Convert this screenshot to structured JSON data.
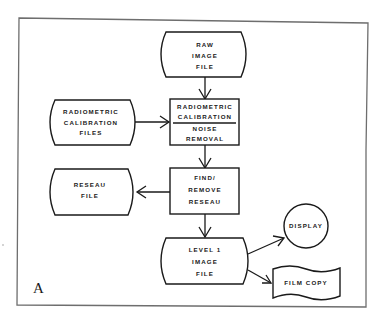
{
  "diagram": {
    "panel_label": "A",
    "nodes": {
      "raw_image_file": {
        "type": "stored-data",
        "lines": [
          "RAW",
          "IMAGE",
          "FILE"
        ]
      },
      "radiometric_calibration_files": {
        "type": "stored-data",
        "lines": [
          "RADIOMETRIC",
          "CALIBRATION",
          "FILES"
        ]
      },
      "calibration_process": {
        "type": "process",
        "top_lines": [
          "RADIOMETRIC",
          "CALIBRATION"
        ],
        "bottom_lines": [
          "NOISE",
          "REMOVAL"
        ]
      },
      "find_remove_reseau": {
        "type": "process",
        "lines": [
          "FIND/",
          "REMOVE",
          "RESEAU"
        ]
      },
      "reseau_file": {
        "type": "stored-data",
        "lines": [
          "RESEAU",
          "FILE"
        ]
      },
      "level1_image_file": {
        "type": "stored-data",
        "lines": [
          "LEVEL 1",
          "IMAGE",
          "FILE"
        ]
      },
      "display": {
        "type": "connector-circle",
        "lines": [
          "DISPLAY"
        ]
      },
      "film_copy": {
        "type": "document-wave",
        "lines": [
          "FILM COPY"
        ]
      }
    },
    "edges": [
      {
        "from": "raw_image_file",
        "to": "calibration_process"
      },
      {
        "from": "radiometric_calibration_files",
        "to": "calibration_process"
      },
      {
        "from": "calibration_process",
        "to": "find_remove_reseau"
      },
      {
        "from": "find_remove_reseau",
        "to": "reseau_file"
      },
      {
        "from": "find_remove_reseau",
        "to": "level1_image_file"
      },
      {
        "from": "level1_image_file",
        "to": "display"
      },
      {
        "from": "level1_image_file",
        "to": "film_copy"
      }
    ]
  }
}
